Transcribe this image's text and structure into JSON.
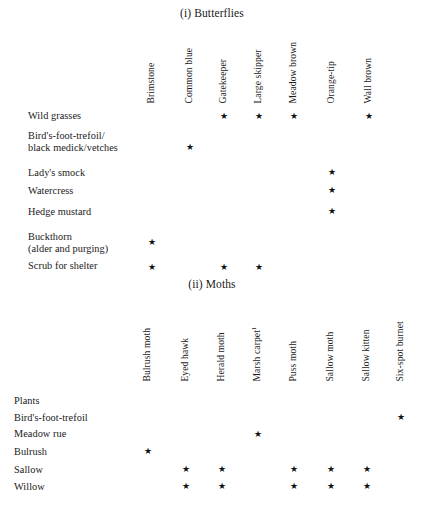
{
  "figure": {
    "star_glyph": "★",
    "footnote_marker": "1"
  },
  "sections": [
    {
      "id": "butterflies",
      "title": "(i) Butterflies",
      "columns": [
        "Brimstone",
        "Common blue",
        "Gatekeeper",
        "Large skipper",
        "Meadow brown",
        "Orange-tip",
        "Wall brown"
      ],
      "rows": [
        {
          "label": "Wild grasses",
          "label2": "",
          "marks": [
            0,
            0,
            1,
            1,
            1,
            0,
            1
          ]
        },
        {
          "label": "Bird's-foot-trefoil/",
          "label2": "black medick/vetches",
          "marks": [
            0,
            1,
            0,
            0,
            0,
            0,
            0
          ]
        },
        {
          "label": "Lady's smock",
          "label2": "",
          "marks": [
            0,
            0,
            0,
            0,
            0,
            1,
            0
          ]
        },
        {
          "label": "Watercress",
          "label2": "",
          "marks": [
            0,
            0,
            0,
            0,
            0,
            1,
            0
          ]
        },
        {
          "label": "Hedge mustard",
          "label2": "",
          "marks": [
            0,
            0,
            0,
            0,
            0,
            1,
            0
          ]
        },
        {
          "label": "Buckthorn",
          "label2": "(alder and purging)",
          "marks": [
            1,
            0,
            0,
            0,
            0,
            0,
            0
          ]
        },
        {
          "label": "Scrub for shelter",
          "label2": "",
          "marks": [
            1,
            0,
            1,
            1,
            0,
            0,
            0
          ]
        }
      ]
    },
    {
      "id": "moths",
      "title": "(ii) Moths",
      "columns": [
        "Bulrush moth",
        "Eyed hawk",
        "Herald moth",
        "Marsh carpet",
        "Puss moth",
        "Sallow moth",
        "Sallow kitten",
        "Six-spot burnet"
      ],
      "rows": [
        {
          "label": "Plants",
          "label2": "",
          "marks": [
            0,
            0,
            0,
            0,
            0,
            0,
            0,
            0
          ]
        },
        {
          "label": "Bird's-foot-trefoil",
          "label2": "",
          "marks": [
            0,
            0,
            0,
            0,
            0,
            0,
            0,
            1
          ]
        },
        {
          "label": "Meadow rue",
          "label2": "",
          "marks": [
            0,
            0,
            0,
            1,
            0,
            0,
            0,
            0
          ]
        },
        {
          "label": "Bulrush",
          "label2": "",
          "marks": [
            1,
            0,
            0,
            0,
            0,
            0,
            0,
            0
          ]
        },
        {
          "label": "Sallow",
          "label2": "",
          "marks": [
            0,
            1,
            1,
            0,
            1,
            1,
            1,
            0
          ]
        },
        {
          "label": "Willow",
          "label2": "",
          "marks": [
            0,
            1,
            1,
            0,
            1,
            1,
            1,
            0
          ]
        }
      ]
    }
  ]
}
